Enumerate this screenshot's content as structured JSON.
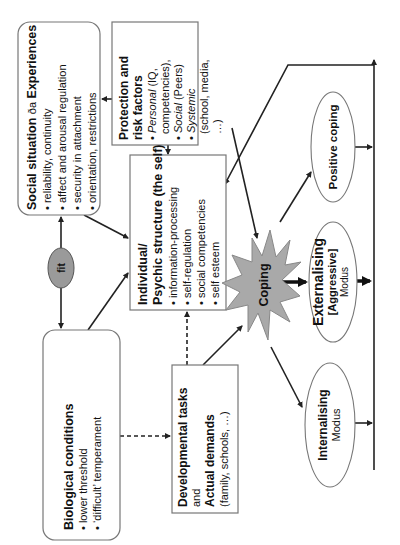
{
  "diagram": {
    "orientation": "rotated-90-ccw",
    "colors": {
      "line": "#222222",
      "box_border": "#777777",
      "coping_fill": "#a9a9a9",
      "fit_fill": "#9a9a9a",
      "background": "#ffffff"
    },
    "social_situation": {
      "title_a": "Social situation ",
      "title_sym": "ða",
      "title_b": " Experiences",
      "items": [
        "• reliability, continuity",
        "• affect and arousal regulation",
        "• security in attachment",
        "• orientation, restrictions"
      ]
    },
    "protection": {
      "title_line1": "Protection and",
      "title_line2": "risk factors",
      "personal_label": "Personal",
      "personal_rest": " (IQ,",
      "personal_line2": "competencies),",
      "social_label": "Social",
      "social_rest": " (Peers)",
      "systemic_label": "Systemic",
      "systemic_line2": "(school, media,",
      "systemic_line3": "…)",
      "bullet": "•"
    },
    "psychic_structure": {
      "title_line1": "Individual/",
      "title_line2": "Psychic structure (the self)",
      "items": [
        "• information-processing",
        "• self-regulation",
        "• social competencies",
        "• self esteem"
      ]
    },
    "fit": {
      "label": "fit"
    },
    "biological": {
      "title": "Biological conditions",
      "items": [
        "• lower threshold",
        "• ‘difficult’ temperament"
      ]
    },
    "developmental": {
      "title": "Developmental tasks",
      "connector": "and",
      "title2": "Actual demands",
      "detail": "(family, schools, …)"
    },
    "coping": {
      "label": "Coping"
    },
    "positive_coping": {
      "label": "Positive coping"
    },
    "externalising": {
      "title": "Externalising",
      "subtitle": "[Aggressive]",
      "mode": "Modus"
    },
    "internalising": {
      "title": "Internalising",
      "mode": "Modus"
    }
  }
}
